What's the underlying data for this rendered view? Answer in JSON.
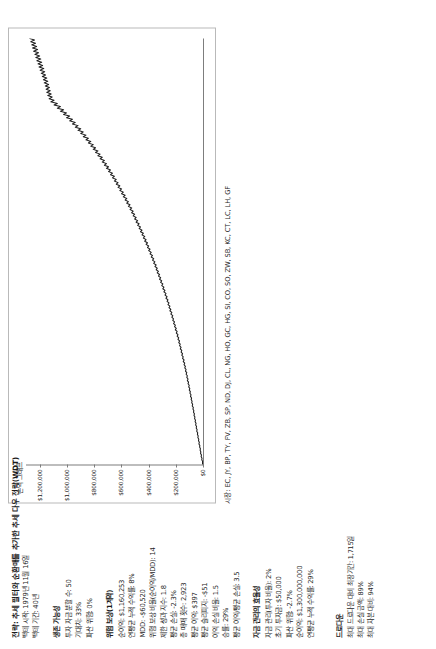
{
  "report": {
    "title": "전략: 추세 필터와 순환매를 추가한 추세 다우 전략(WDT)",
    "period_lines": [
      "백테 시작: 1979년 11월 16일",
      "백테 기간: 40년"
    ],
    "sections": [
      {
        "heading": "생존 가능성",
        "lines": [
          "투자 자금 분할 수: 50",
          "기대치: 33%",
          "파산 위험: 0%"
        ]
      },
      {
        "heading": "위험 보상(1계약)",
        "lines": [
          "순이익: $1,160,253",
          "연평균 누적 수익률: 8%",
          "MDD: -$60,520",
          "위험 보상 비율(순이익/MDD): 14",
          "제한 성과 지수: 1.8",
          "평균 손실: -2.3%",
          "총 매매 횟수: 2,923",
          "평균 이익: $397",
          "평균 슬리피지: -$51",
          "이익 손실 비율: 1.5",
          "승률: 29%",
          "평균 이익/평균 손실: 3.5"
        ]
      },
      {
        "heading": "자금 관리의 효율성",
        "lines": [
          "자금 관리(투자 비율): 2%",
          "초기 투자금: $50,000",
          "파산 위험: -2.7%",
          "순이익: $1,300,000,000",
          "연평균 누적 수익률: 29%"
        ]
      }
    ],
    "footer": {
      "heading": "드로다운",
      "lines": [
        "최대 드로다운 대비 최장기간: 1,715일",
        "최대 손실 금액: 89%",
        "최대 자본 대비: 94%"
      ]
    }
  },
  "markets": {
    "label": "시장: EC, JY, BP, TY, FV, ZB, SP, ND, DJ, CL, NG, HO, GC, HG, SI, CO, SO, ZW, SB, KC, CT, LC, LH, GF"
  },
  "chart_data": {
    "type": "line",
    "title": "손익 그래프",
    "xlabel": "",
    "ylabel": "",
    "ylim": [
      0,
      1300000
    ],
    "grid": false,
    "legend": "none",
    "ytick_labels": [
      "$1,200,000",
      "$1,000,000",
      "$800,000",
      "$600,000",
      "$400,000",
      "$200,000",
      "$0"
    ],
    "ytick_values": [
      1200000,
      1000000,
      800000,
      600000,
      400000,
      200000,
      0
    ],
    "series": [
      {
        "name": "누적 순손익",
        "values": [
          2000,
          4000,
          3000,
          9000,
          7000,
          14000,
          11000,
          18000,
          16000,
          21000,
          19000,
          25000,
          23000,
          30000,
          27000,
          33000,
          31000,
          38000,
          35000,
          41000,
          39000,
          46000,
          43000,
          50000,
          47000,
          54000,
          51000,
          58000,
          55000,
          62000,
          59000,
          66000,
          63000,
          70000,
          67000,
          74000,
          71000,
          79000,
          76000,
          83000,
          80000,
          87000,
          84000,
          92000,
          88000,
          96000,
          93000,
          101000,
          97000,
          105000,
          101000,
          110000,
          106000,
          115000,
          110000,
          119000,
          115000,
          124000,
          119000,
          129000,
          124000,
          134000,
          129000,
          139000,
          134000,
          145000,
          139000,
          150000,
          145000,
          156000,
          150000,
          161000,
          156000,
          167000,
          161000,
          172000,
          167000,
          178000,
          172000,
          184000,
          178000,
          190000,
          184000,
          196000,
          190000,
          203000,
          196000,
          209000,
          203000,
          216000,
          209000,
          222000,
          216000,
          229000,
          222000,
          236000,
          229000,
          243000,
          236000,
          250000,
          243000,
          257000,
          250000,
          264000,
          257000,
          272000,
          264000,
          279000,
          272000,
          287000,
          279000,
          295000,
          287000,
          303000,
          295000,
          311000,
          303000,
          319000,
          311000,
          327000,
          319000,
          336000,
          327000,
          344000,
          336000,
          353000,
          344000,
          362000,
          353000,
          371000,
          362000,
          380000,
          371000,
          389000,
          380000,
          399000,
          389000,
          408000,
          399000,
          418000,
          408000,
          428000,
          418000,
          438000,
          428000,
          448000,
          438000,
          459000,
          448000,
          469000,
          459000,
          480000,
          469000,
          491000,
          480000,
          502000,
          491000,
          513000,
          502000,
          524000,
          513000,
          536000,
          524000,
          548000,
          536000,
          560000,
          548000,
          572000,
          560000,
          585000,
          572000,
          598000,
          585000,
          611000,
          598000,
          624000,
          611000,
          637000,
          624000,
          651000,
          637000,
          665000,
          651000,
          679000,
          665000,
          694000,
          679000,
          709000,
          694000,
          724000,
          709000,
          740000,
          724000,
          756000,
          740000,
          772000,
          756000,
          789000,
          772000,
          806000,
          789000,
          824000,
          806000,
          842000,
          824000,
          860000,
          842000,
          879000,
          860000,
          898000,
          879000,
          918000,
          898000,
          938000,
          918000,
          959000,
          938000,
          980000,
          959000,
          1002000,
          980000,
          1024000,
          1002000,
          1047000,
          1024000,
          1070000,
          1047000,
          1094000,
          1070000,
          1118000,
          1094000,
          1130000,
          1108000,
          1140000,
          1115000,
          1148000,
          1122000,
          1152000,
          1128000,
          1158000,
          1134000,
          1166000,
          1140000,
          1172000,
          1148000,
          1180000,
          1156000,
          1188000,
          1163000,
          1196000,
          1170000,
          1204000,
          1178000,
          1212000,
          1185000,
          1220000,
          1192000,
          1228000,
          1200000,
          1235000,
          1208000,
          1244000,
          1215000,
          1252000,
          1222000,
          1258000,
          1230000,
          1265000,
          1238000,
          1272000
        ]
      }
    ]
  }
}
